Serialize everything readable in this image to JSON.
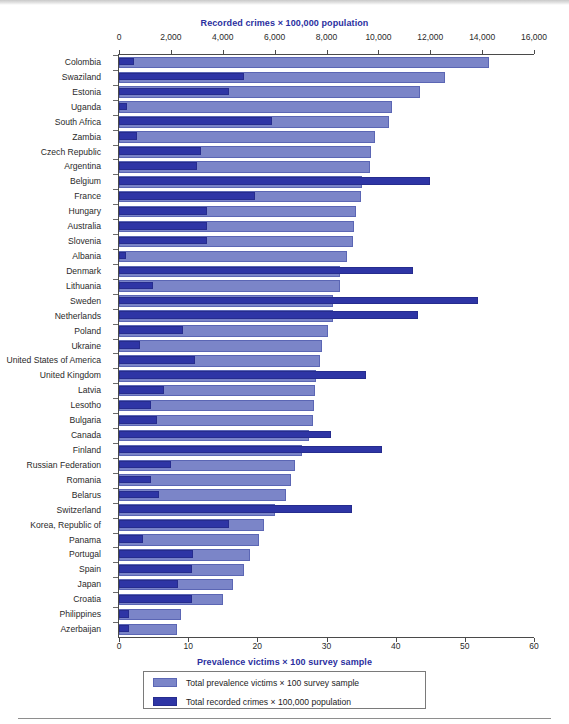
{
  "chart_data": {
    "type": "bar",
    "orientation": "horizontal",
    "layout": "grouped-overlay",
    "title": "",
    "top_axis": {
      "label": "Recorded crimes × 100,000 population",
      "ticks": [
        0,
        2000,
        4000,
        6000,
        8000,
        10000,
        12000,
        14000,
        16000
      ],
      "tick_labels": [
        "0",
        "2,000",
        "4,000",
        "6,000",
        "8,000",
        "10,000",
        "12,000",
        "14,000",
        "16,000"
      ],
      "range": [
        0,
        16000
      ]
    },
    "bottom_axis": {
      "label": "Prevalence victims × 100 survey sample",
      "ticks": [
        0,
        10,
        20,
        30,
        40,
        50,
        60
      ],
      "tick_labels": [
        "0",
        "10",
        "20",
        "30",
        "40",
        "50",
        "60"
      ],
      "range": [
        0,
        60
      ]
    },
    "grid": false,
    "legend_position": "bottom-center",
    "legend": [
      {
        "name": "Total prevalence victims × 100 survey sample",
        "color": "#7b85c8"
      },
      {
        "name": "Total recorded crimes × 100,000 population",
        "color": "#2e35a5"
      }
    ],
    "categories": [
      "Colombia",
      "Swaziland",
      "Estonia",
      "Uganda",
      "South Africa",
      "Zambia",
      "Czech Republic",
      "Argentina",
      "Belgium",
      "France",
      "Hungary",
      "Australia",
      "Slovenia",
      "Albania",
      "Denmark",
      "Lithuania",
      "Sweden",
      "Netherlands",
      "Poland",
      "Ukraine",
      "United States of America",
      "United Kingdom",
      "Latvia",
      "Lesotho",
      "Bulgaria",
      "Canada",
      "Finland",
      "Russian Federation",
      "Romania",
      "Belarus",
      "Switzerland",
      "Korea, Republic of",
      "Panama",
      "Portugal",
      "Spain",
      "Japan",
      "Croatia",
      "Philippines",
      "Azerbaijan"
    ],
    "series": [
      {
        "name": "Total prevalence victims × 100 survey sample",
        "color": "#7b85c8",
        "axis": "bottom",
        "units": "victims per 100 survey sample",
        "values": [
          53.5,
          47.2,
          43.5,
          39.5,
          39.0,
          37.0,
          36.5,
          36.3,
          35.2,
          35.0,
          34.2,
          34.0,
          33.8,
          33.0,
          32.0,
          31.9,
          31.0,
          30.9,
          30.2,
          29.4,
          29.0,
          28.5,
          28.3,
          28.2,
          28.1,
          27.5,
          26.5,
          25.5,
          24.9,
          24.2,
          22.6,
          20.9,
          20.3,
          19.0,
          18.0,
          16.5,
          15.0,
          9.0,
          8.4
        ]
      },
      {
        "name": "Total recorded crimes × 100,000 population",
        "color": "#2e35a5",
        "axis": "top",
        "units": "recorded crimes per 100,000 population",
        "values": [
          590,
          4800,
          4230,
          310,
          5880,
          680,
          3160,
          3010,
          11980,
          5240,
          3400,
          3400,
          3400,
          260,
          11320,
          1330,
          13840,
          11520,
          2460,
          820,
          2920,
          9510,
          1750,
          1230,
          1480,
          8190,
          10140,
          2000,
          1230,
          1530,
          8990,
          4260,
          930,
          2860,
          2830,
          2290,
          2830,
          400,
          390
        ]
      }
    ]
  }
}
